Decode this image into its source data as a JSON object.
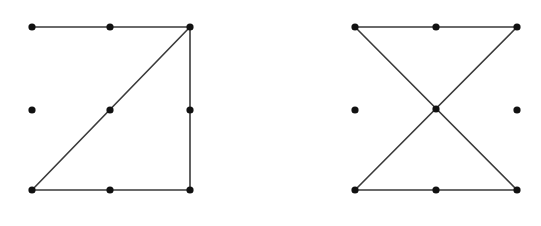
{
  "diagram": {
    "type": "dot-grid-graphs",
    "background": "#ffffff",
    "edge_color": "#3a3a3a",
    "dot_color": "#111111",
    "figures": [
      {
        "name": "left-figure",
        "grid": "3x3",
        "nodes": [
          {
            "id": "a1",
            "x": 32,
            "y": 27
          },
          {
            "id": "a2",
            "x": 110,
            "y": 27
          },
          {
            "id": "a3",
            "x": 190,
            "y": 27
          },
          {
            "id": "b1",
            "x": 32,
            "y": 110
          },
          {
            "id": "b2",
            "x": 110,
            "y": 110
          },
          {
            "id": "b3",
            "x": 190,
            "y": 110
          },
          {
            "id": "c1",
            "x": 32,
            "y": 190
          },
          {
            "id": "c2",
            "x": 110,
            "y": 190
          },
          {
            "id": "c3",
            "x": 190,
            "y": 190
          }
        ],
        "edges": [
          {
            "from": "a1",
            "to": "a3"
          },
          {
            "from": "a3",
            "to": "c1"
          },
          {
            "from": "a3",
            "to": "c3"
          },
          {
            "from": "c1",
            "to": "c3"
          }
        ]
      },
      {
        "name": "right-figure",
        "grid": "3x3",
        "nodes": [
          {
            "id": "a1",
            "x": 355,
            "y": 27
          },
          {
            "id": "a2",
            "x": 436,
            "y": 27
          },
          {
            "id": "a3",
            "x": 517,
            "y": 27
          },
          {
            "id": "b1",
            "x": 355,
            "y": 110
          },
          {
            "id": "b2",
            "x": 436,
            "y": 109
          },
          {
            "id": "b3",
            "x": 517,
            "y": 110
          },
          {
            "id": "c1",
            "x": 355,
            "y": 190
          },
          {
            "id": "c2",
            "x": 436,
            "y": 190
          },
          {
            "id": "c3",
            "x": 517,
            "y": 190
          }
        ],
        "edges": [
          {
            "from": "a1",
            "to": "a3"
          },
          {
            "from": "a1",
            "to": "c3"
          },
          {
            "from": "a3",
            "to": "c1"
          },
          {
            "from": "c1",
            "to": "c3"
          }
        ]
      }
    ]
  }
}
